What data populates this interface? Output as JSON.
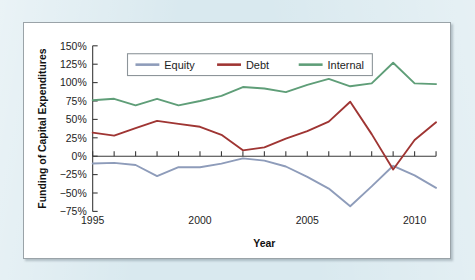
{
  "page": {
    "background_color": "#d9e9ef",
    "panel_background_color": "#ffffff",
    "panel_border_color": "#9aa3a8"
  },
  "chart_data": {
    "type": "line",
    "title": "",
    "xlabel": "Year",
    "ylabel": "Funding of Capital Expenditures",
    "x": [
      1995,
      1996,
      1997,
      1998,
      1999,
      2000,
      2001,
      2002,
      2003,
      2004,
      2005,
      2006,
      2007,
      2008,
      2009,
      2010,
      2011
    ],
    "xlim": [
      1995,
      2011
    ],
    "ylim": [
      -75,
      150
    ],
    "xticks": [
      1995,
      2000,
      2005,
      2010
    ],
    "xtick_labels": [
      "1995",
      "2000",
      "2005",
      "2010"
    ],
    "yticks": [
      -75,
      -50,
      -25,
      0,
      25,
      50,
      75,
      100,
      125,
      150
    ],
    "ytick_labels": [
      "−75%",
      "−50%",
      "−25%",
      "0%",
      "25%",
      "50%",
      "75%",
      "100%",
      "125%",
      "150%"
    ],
    "grid": false,
    "zero_line": true,
    "legend_position": "upper-center",
    "series": [
      {
        "name": "Equity",
        "color": "#8e9cba",
        "values": [
          -10,
          -9,
          -12,
          -27,
          -15,
          -15,
          -10,
          -3,
          -6,
          -14,
          -28,
          -44,
          -68,
          -41,
          -13,
          -26,
          -43
        ]
      },
      {
        "name": "Debt",
        "color": "#9f3533",
        "values": [
          32,
          28,
          38,
          48,
          44,
          40,
          29,
          8,
          12,
          24,
          34,
          47,
          74,
          30,
          -18,
          22,
          46
        ]
      },
      {
        "name": "Internal",
        "color": "#5f9e78",
        "values": [
          76,
          78,
          69,
          78,
          69,
          75,
          82,
          94,
          92,
          87,
          97,
          105,
          95,
          99,
          127,
          99,
          98
        ]
      }
    ]
  }
}
